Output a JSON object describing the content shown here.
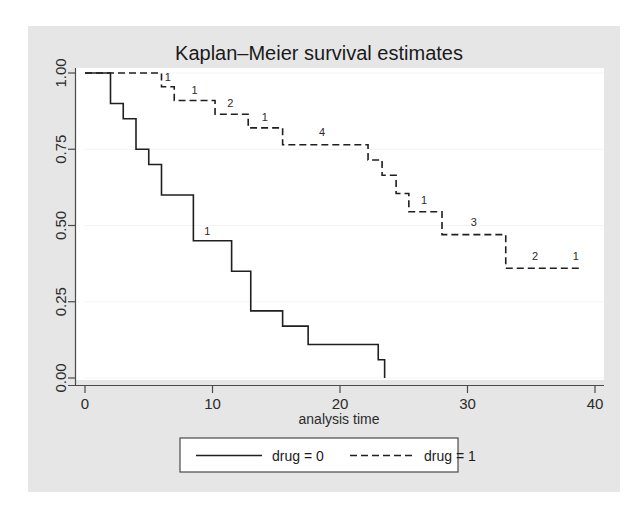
{
  "chart_data": {
    "type": "line",
    "title": "Kaplan–Meier survival estimates",
    "xlabel": "analysis time",
    "ylabel": "",
    "xlim": [
      0,
      40
    ],
    "ylim": [
      0,
      1
    ],
    "xticks": [
      0,
      10,
      20,
      30,
      40
    ],
    "xticklabels": [
      "0",
      "10",
      "20",
      "30",
      "40"
    ],
    "yticks": [
      0.0,
      0.25,
      0.5,
      0.75,
      1.0
    ],
    "yticklabels": [
      "0.00",
      "0.25",
      "0.50",
      "0.75",
      "1.00"
    ],
    "grid": true,
    "grid_axis": "y",
    "legend_position": "bottom-center",
    "series": [
      {
        "name": "drug = 0",
        "style": "solid",
        "color": "#1f1f1f",
        "step": "post",
        "points": [
          {
            "t": 0,
            "s": 1.0
          },
          {
            "t": 1,
            "s": 1.0
          },
          {
            "t": 2,
            "s": 0.9
          },
          {
            "t": 3,
            "s": 0.85
          },
          {
            "t": 4,
            "s": 0.75
          },
          {
            "t": 5,
            "s": 0.7
          },
          {
            "t": 6,
            "s": 0.6
          },
          {
            "t": 8,
            "s": 0.6
          },
          {
            "t": 8.5,
            "s": 0.45
          },
          {
            "t": 11,
            "s": 0.45
          },
          {
            "t": 11.5,
            "s": 0.35
          },
          {
            "t": 12.5,
            "s": 0.35
          },
          {
            "t": 13,
            "s": 0.22
          },
          {
            "t": 15,
            "s": 0.22
          },
          {
            "t": 15.5,
            "s": 0.17
          },
          {
            "t": 17,
            "s": 0.17
          },
          {
            "t": 17.5,
            "s": 0.11
          },
          {
            "t": 22.5,
            "s": 0.11
          },
          {
            "t": 23,
            "s": 0.06
          },
          {
            "t": 23.5,
            "s": 0.06
          },
          {
            "t": 23.5,
            "s": 0.0
          }
        ],
        "at_risk_labels": [
          {
            "t": 9.6,
            "s": 0.47,
            "text": "1"
          }
        ]
      },
      {
        "name": "drug = 1",
        "style": "dashed",
        "color": "#1f1f1f",
        "step": "post",
        "points": [
          {
            "t": 0,
            "s": 1.0
          },
          {
            "t": 6.0,
            "s": 1.0
          },
          {
            "t": 6.0,
            "s": 0.955
          },
          {
            "t": 7.0,
            "s": 0.955
          },
          {
            "t": 7.0,
            "s": 0.91
          },
          {
            "t": 10.2,
            "s": 0.91
          },
          {
            "t": 10.2,
            "s": 0.865
          },
          {
            "t": 12.8,
            "s": 0.865
          },
          {
            "t": 12.8,
            "s": 0.82
          },
          {
            "t": 15.5,
            "s": 0.82
          },
          {
            "t": 15.5,
            "s": 0.765
          },
          {
            "t": 22.2,
            "s": 0.765
          },
          {
            "t": 22.2,
            "s": 0.715
          },
          {
            "t": 23.3,
            "s": 0.715
          },
          {
            "t": 23.3,
            "s": 0.665
          },
          {
            "t": 24.4,
            "s": 0.665
          },
          {
            "t": 24.4,
            "s": 0.605
          },
          {
            "t": 25.4,
            "s": 0.605
          },
          {
            "t": 25.4,
            "s": 0.545
          },
          {
            "t": 28.0,
            "s": 0.545
          },
          {
            "t": 28.0,
            "s": 0.47
          },
          {
            "t": 33.0,
            "s": 0.47
          },
          {
            "t": 33.0,
            "s": 0.36
          },
          {
            "t": 39.0,
            "s": 0.36
          }
        ],
        "at_risk_labels": [
          {
            "t": 6.5,
            "s": 0.975,
            "text": "1"
          },
          {
            "t": 8.6,
            "s": 0.932,
            "text": "1"
          },
          {
            "t": 11.4,
            "s": 0.888,
            "text": "2"
          },
          {
            "t": 14.1,
            "s": 0.843,
            "text": "1"
          },
          {
            "t": 18.6,
            "s": 0.792,
            "text": "4"
          },
          {
            "t": 26.6,
            "s": 0.572,
            "text": "1"
          },
          {
            "t": 30.5,
            "s": 0.497,
            "text": "3"
          },
          {
            "t": 35.3,
            "s": 0.388,
            "text": "2"
          },
          {
            "t": 38.5,
            "s": 0.388,
            "text": "1"
          }
        ]
      }
    ]
  },
  "legend": {
    "entries": [
      {
        "label": "drug = 0",
        "style": "solid"
      },
      {
        "label": "drug = 1",
        "style": "dashed"
      }
    ]
  },
  "colors": {
    "figure_background": "#ffffff",
    "plot_canvas_background": "#e6e6e6",
    "plot_region_background": "#ffffff",
    "line": "#1f1f1f",
    "gridline": "#f4f4f4",
    "axis": "#4a4a4a",
    "text": "#1a1a1a"
  }
}
